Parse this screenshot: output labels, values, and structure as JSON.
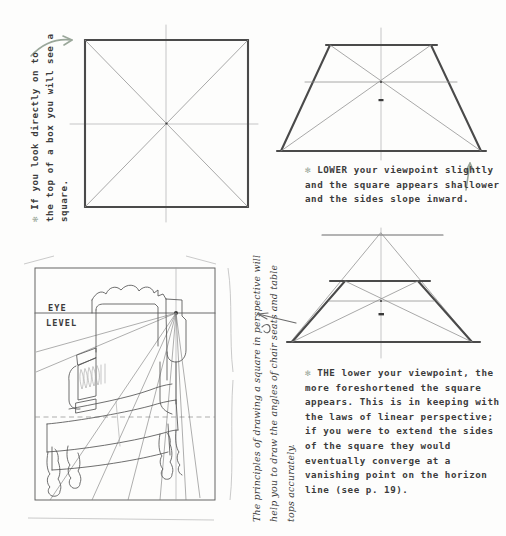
{
  "page": {
    "background_color": "#fdfdfc",
    "ink_color": "#3b3b3b",
    "accent_color": "#9aa79a"
  },
  "captions": {
    "square": {
      "bullet": "✻",
      "text": "If you look directly on to the top of a box you will see a square."
    },
    "lower_viewpoint": {
      "bullet": "✻",
      "text": "LOWER your viewpoint slightly and the square appears shallower and the sides slope inward."
    },
    "the_lower_viewpoint": {
      "bullet": "✻",
      "text": "THE lower your viewpoint, the more foreshortened the square appears. This is in keeping with the laws of linear perspective; if you were to extend the sides of the square they would eventually converge at a vanishing point on the horizon line (see p. 19)."
    },
    "chair_note": {
      "text": "The principles of drawing a square in perspective will help you to draw the angles of chair seats and table tops accurately."
    }
  },
  "chair_diagram": {
    "eye_label": "EYE",
    "level_label": "LEVEL"
  },
  "icons": {
    "curved_arrow": "curved-arrow-icon",
    "up_arrow": "up-arrow-icon",
    "asterisk": "asterisk-bullet-icon"
  }
}
